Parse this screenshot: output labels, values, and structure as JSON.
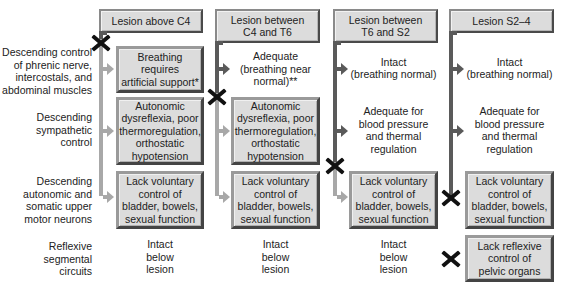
{
  "row_labels": [
    "Descending control\nof phrenic nerve,\nintercostals, and\nabdominal muscles",
    "Descending\nsympathetic\ncontrol",
    "Descending\nautonomic and\nsomatic upper\nmotor neurons",
    "Reflexive\nsegmental\ncircuits"
  ],
  "columns": [
    {
      "header": "Lesion above C4",
      "cells": [
        {
          "text": "Breathing\nrequires\nartificial support*",
          "boxed": true
        },
        {
          "text": "Autonomic\ndysreflexia, poor\nthermoregulation,\northostatic\nhypotension",
          "boxed": true
        },
        {
          "text": "Lack voluntary\ncontrol of\nbladder, bowels,\nsexual function",
          "boxed": true
        },
        {
          "text": "Intact\nbelow\nlesion",
          "boxed": false
        }
      ]
    },
    {
      "header": "Lesion between\nC4 and T6",
      "cells": [
        {
          "text": "Adequate\n(breathing near\nnormal)**",
          "boxed": false
        },
        {
          "text": "Autonomic\ndysreflexia, poor\nthermoregulation,\northostatic\nhypotension",
          "boxed": true
        },
        {
          "text": "Lack voluntary\ncontrol of\nbladder, bowels,\nsexual function",
          "boxed": true
        },
        {
          "text": "Intact\nbelow\nlesion",
          "boxed": false
        }
      ]
    },
    {
      "header": "Lesion between\nT6 and S2",
      "cells": [
        {
          "text": "Intact\n(breathing normal)",
          "boxed": false
        },
        {
          "text": "Adequate for\nblood pressure\nand thermal\nregulation",
          "boxed": false
        },
        {
          "text": "Lack voluntary\ncontrol of\nbladder, bowels,\nsexual function",
          "boxed": true
        },
        {
          "text": "Intact\nbelow\nlesion",
          "boxed": false
        }
      ]
    },
    {
      "header": "Lesion S2–4",
      "cells": [
        {
          "text": "Intact\n(breathing normal)",
          "boxed": false
        },
        {
          "text": "Adequate for\nblood pressure\nand thermal\nregulation",
          "boxed": false
        },
        {
          "text": "Lack voluntary\ncontrol of\nbladder, bowels,\nsexual function",
          "boxed": true
        },
        {
          "text": "Lack reflexive\ncontrol of\npelvic organs",
          "boxed": true
        }
      ]
    }
  ],
  "colors": {
    "box_fill": "#dcdcdc",
    "line_intact": "#5a5a5a",
    "line_lesioned": "#a8a8a8",
    "lesion_mark": "#111111"
  }
}
